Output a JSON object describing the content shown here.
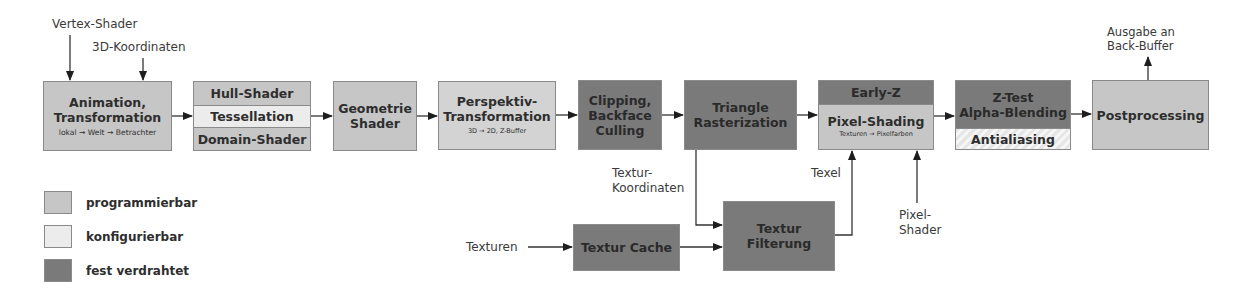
{
  "diagram": {
    "inputs": {
      "vertex_shader": "Vertex-Shader",
      "coords_3d": "3D-Koordinaten",
      "output": "Ausgabe an\nBack-Buffer",
      "output_line1": "Ausgabe an",
      "output_line2": "Back-Buffer",
      "texture_coords_line1": "Textur-",
      "texture_coords_line2": "Koordinaten",
      "textures": "Texturen",
      "texel": "Texel",
      "pixel_shader_line1": "Pixel-",
      "pixel_shader_line2": "Shader"
    },
    "stages": [
      {
        "id": "animation",
        "title_line1": "Animation,",
        "title_line2": "Transformation",
        "subtitle": "lokal → Welt → Betrachter",
        "type": "programmierbar"
      },
      {
        "id": "tessellation",
        "bands": [
          "Hull-Shader",
          "Tessellation",
          "Domain-Shader"
        ],
        "types": [
          "programmierbar",
          "konfigurierbar",
          "programmierbar"
        ]
      },
      {
        "id": "geometry",
        "title_line1": "Geometrie",
        "title_line2": "Shader",
        "type": "programmierbar"
      },
      {
        "id": "perspective",
        "title_line1": "Perspektiv-",
        "title_line2": "Transformation",
        "subtitle": "3D → 2D, Z-Buffer",
        "type": "programmierbar"
      },
      {
        "id": "clipping",
        "title_line1": "Clipping,",
        "title_line2": "Backface",
        "title_line3": "Culling",
        "type": "fest verdrahtet"
      },
      {
        "id": "rasterization",
        "title_line1": "Triangle",
        "title_line2": "Rasterization",
        "type": "fest verdrahtet"
      },
      {
        "id": "pixel_shading",
        "header": "Early-Z",
        "title": "Pixel-Shading",
        "subtitle": "Texturen → Pixelfarben",
        "types": [
          "fest verdrahtet",
          "programmierbar"
        ]
      },
      {
        "id": "ztest",
        "title_line1": "Z-Test",
        "title_line2": "Alpha-Blending",
        "footer": "Antialiasing",
        "types": [
          "fest verdrahtet",
          "konfigurierbar"
        ]
      },
      {
        "id": "postprocessing",
        "title": "Postprocessing",
        "type": "programmierbar"
      },
      {
        "id": "texture_cache",
        "title": "Textur Cache",
        "type": "fest verdrahtet"
      },
      {
        "id": "texture_filtering",
        "title_line1": "Textur",
        "title_line2": "Filterung",
        "type": "fest verdrahtet"
      }
    ]
  },
  "legend": {
    "items": [
      {
        "label": "programmierbar",
        "color": "#c6c6c6"
      },
      {
        "label": "konfigurierbar",
        "color": "#ececec"
      },
      {
        "label": "fest verdrahtet",
        "color": "#7a7a7a"
      }
    ]
  },
  "colors": {
    "programmable": "#c6c6c6",
    "configurable": "#ececec",
    "fixed": "#7a7a7a",
    "border": "#8a8a8a",
    "arrow": "#1e1e1e"
  }
}
